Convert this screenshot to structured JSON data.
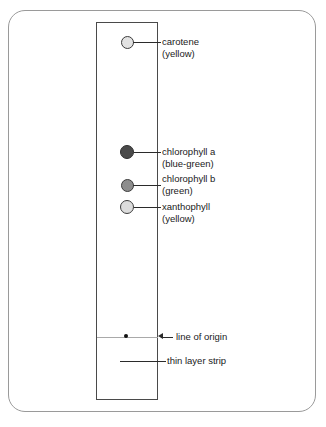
{
  "diagram": {
    "frame": {
      "border_color": "#9a9a9a"
    },
    "strip": {
      "name": "thin layer strip",
      "border_color": "#4a4a4a",
      "background": "#ffffff"
    },
    "origin": {
      "label": "line of origin",
      "line_color": "#a9a9a9",
      "dot_color": "#111111"
    },
    "strip_label": "thin layer strip",
    "spots": [
      {
        "id": "carotene",
        "name": "carotene",
        "color_word": "(yellow)",
        "fill": "#e2e2e2",
        "stroke": "#3c3c3c",
        "center_x": 127,
        "center_y": 42,
        "diameter": 13
      },
      {
        "id": "chlorophyll-a",
        "name": "chlorophyll a",
        "color_word": "(blue-green)",
        "fill": "#4a4a4a",
        "stroke": "#2e2e2e",
        "center_x": 127,
        "center_y": 152,
        "diameter": 14
      },
      {
        "id": "chlorophyll-b",
        "name": "chlorophyll b",
        "color_word": "(green)",
        "fill": "#8d8d8d",
        "stroke": "#3c3c3c",
        "center_x": 127,
        "center_y": 185,
        "diameter": 13
      },
      {
        "id": "xanthophyll",
        "name": "xanthophyll",
        "color_word": "(yellow)",
        "fill": "#dcdcdc",
        "stroke": "#3c3c3c",
        "center_x": 127,
        "center_y": 207,
        "diameter": 14
      }
    ]
  }
}
